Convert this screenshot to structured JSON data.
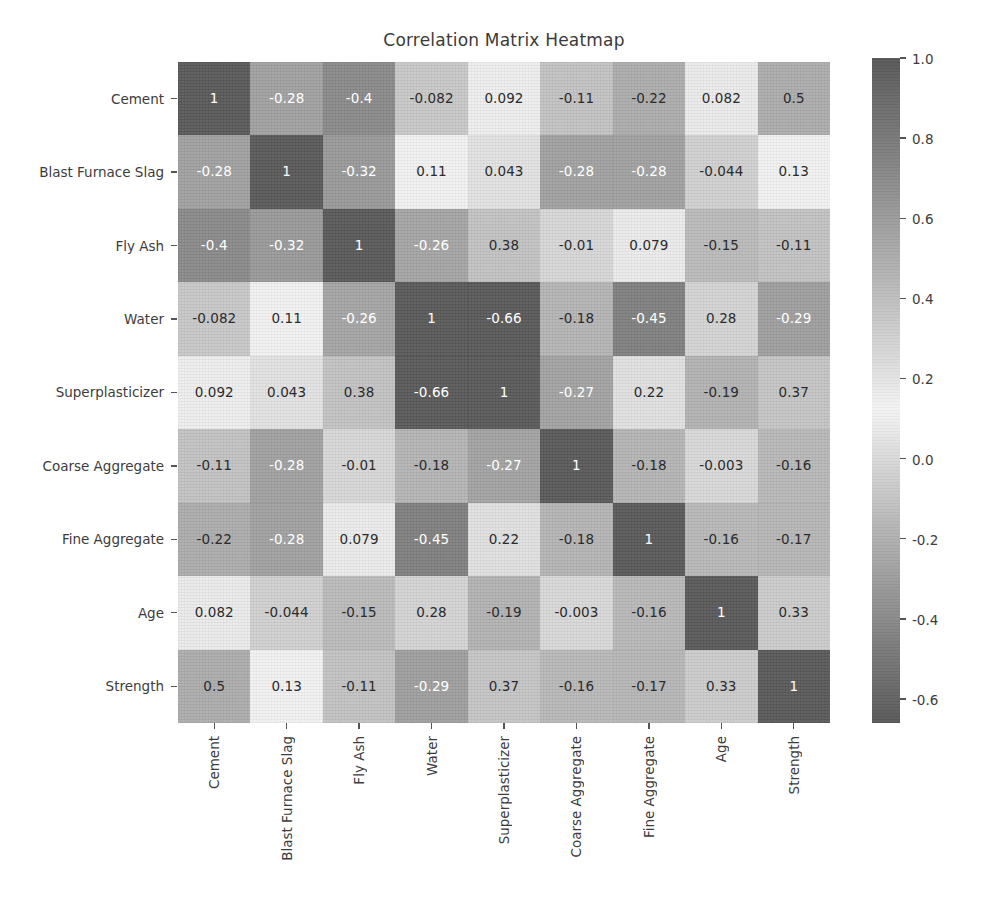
{
  "chart_data": {
    "type": "heatmap",
    "title": "Correlation Matrix Heatmap",
    "xlabel": "",
    "ylabel": "",
    "grid": false,
    "legend_position": "right-colorbar",
    "annotated": true,
    "categories": [
      "Cement",
      "Blast Furnace Slag",
      "Fly Ash",
      "Water",
      "Superplasticizer",
      "Coarse Aggregate",
      "Fine Aggregate",
      "Age",
      "Strength"
    ],
    "x_tick_labels": [
      "Cement",
      "Blast Furnace Slag",
      "Fly Ash",
      "Water",
      "Superplasticizer",
      "Coarse Aggregate",
      "Fine Aggregate",
      "Age",
      "Strength"
    ],
    "y_tick_labels": [
      "Cement",
      "Blast Furnace Slag",
      "Fly Ash",
      "Water",
      "Superplasticizer",
      "Coarse Aggregate",
      "Fine Aggregate",
      "Age",
      "Strength"
    ],
    "values": [
      [
        1,
        -0.28,
        -0.4,
        -0.082,
        0.092,
        -0.11,
        -0.22,
        0.082,
        0.5
      ],
      [
        -0.28,
        1,
        -0.32,
        0.11,
        0.043,
        -0.28,
        -0.28,
        -0.044,
        0.13
      ],
      [
        -0.4,
        -0.32,
        1,
        -0.26,
        0.38,
        -0.01,
        0.079,
        -0.15,
        -0.11
      ],
      [
        -0.082,
        0.11,
        -0.26,
        1,
        -0.66,
        -0.18,
        -0.45,
        0.28,
        -0.29
      ],
      [
        0.092,
        0.043,
        0.38,
        -0.66,
        1,
        -0.27,
        0.22,
        -0.19,
        0.37
      ],
      [
        -0.11,
        -0.28,
        -0.01,
        -0.18,
        -0.27,
        1,
        -0.18,
        -0.003,
        -0.16
      ],
      [
        -0.22,
        -0.28,
        0.079,
        -0.45,
        0.22,
        -0.18,
        1,
        -0.16,
        -0.17
      ],
      [
        0.082,
        -0.044,
        -0.15,
        0.28,
        -0.19,
        -0.003,
        -0.16,
        1,
        0.33
      ],
      [
        0.5,
        0.13,
        -0.11,
        -0.29,
        0.37,
        -0.16,
        -0.17,
        0.33,
        1
      ]
    ],
    "cell_labels": [
      [
        "1",
        "-0.28",
        "-0.4",
        "-0.082",
        "0.092",
        "-0.11",
        "-0.22",
        "0.082",
        "0.5"
      ],
      [
        "-0.28",
        "1",
        "-0.32",
        "0.11",
        "0.043",
        "-0.28",
        "-0.28",
        "-0.044",
        "0.13"
      ],
      [
        "-0.4",
        "-0.32",
        "1",
        "-0.26",
        "0.38",
        "-0.01",
        "0.079",
        "-0.15",
        "-0.11"
      ],
      [
        "-0.082",
        "0.11",
        "-0.26",
        "1",
        "-0.66",
        "-0.18",
        "-0.45",
        "0.28",
        "-0.29"
      ],
      [
        "0.092",
        "0.043",
        "0.38",
        "-0.66",
        "1",
        "-0.27",
        "0.22",
        "-0.19",
        "0.37"
      ],
      [
        "-0.11",
        "-0.28",
        "-0.01",
        "-0.18",
        "-0.27",
        "1",
        "-0.18",
        "-0.003",
        "-0.16"
      ],
      [
        "-0.22",
        "-0.28",
        "0.079",
        "-0.45",
        "0.22",
        "-0.18",
        "1",
        "-0.16",
        "-0.17"
      ],
      [
        "0.082",
        "-0.044",
        "-0.15",
        "0.28",
        "-0.19",
        "-0.003",
        "-0.16",
        "1",
        "0.33"
      ],
      [
        "0.5",
        "0.13",
        "-0.11",
        "-0.29",
        "0.37",
        "-0.16",
        "-0.17",
        "0.33",
        "1"
      ]
    ],
    "colorbar": {
      "vmin": -0.66,
      "vmax": 1.0,
      "tick_labels": [
        "1.0",
        "0.8",
        "0.6",
        "0.4",
        "0.2",
        "0.0",
        "-0.2",
        "-0.4",
        "-0.6"
      ],
      "tick_values": [
        1.0,
        0.8,
        0.6,
        0.4,
        0.2,
        0.0,
        -0.2,
        -0.4,
        -0.6
      ],
      "colormap": "grayscale-diverging"
    },
    "colors": {
      "dark": "#585858",
      "light": "#f2f2f2",
      "mid": "#b4b4b4",
      "text_dark": "#2b2b2b",
      "text_light": "#ffffff",
      "background": "#ffffff"
    }
  }
}
